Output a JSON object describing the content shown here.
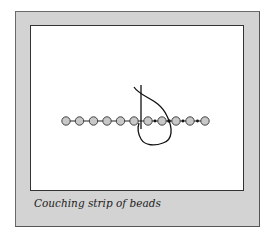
{
  "figure": {
    "caption": "Couching strip of beads",
    "bead_count": 11,
    "bead_fill": "#c8c8c8",
    "frame_color": "#d3d3d3",
    "panel_color": "#ffffff"
  }
}
